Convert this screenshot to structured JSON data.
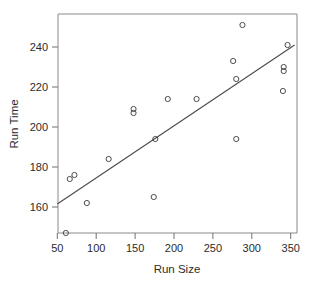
{
  "chart_data": {
    "type": "scatter",
    "title": "",
    "xlabel": "Run Size",
    "ylabel": "Run Time",
    "xlim": [
      47,
      355
    ],
    "ylim": [
      143,
      256
    ],
    "grid": false,
    "legend": null,
    "xticks": [
      50,
      100,
      150,
      200,
      250,
      300,
      350
    ],
    "xtick_labels": [
      "50",
      "100",
      "150",
      "200",
      "250",
      "300",
      "350"
    ],
    "yticks": [
      160,
      180,
      200,
      220,
      240
    ],
    "ytick_labels": [
      "160",
      "180",
      "200",
      "220",
      "240"
    ],
    "marker": "open-circle",
    "points": [
      {
        "x": 61,
        "y": 147
      },
      {
        "x": 66,
        "y": 174
      },
      {
        "x": 72,
        "y": 176
      },
      {
        "x": 88,
        "y": 162
      },
      {
        "x": 116,
        "y": 184
      },
      {
        "x": 148,
        "y": 207
      },
      {
        "x": 148,
        "y": 209
      },
      {
        "x": 174,
        "y": 165
      },
      {
        "x": 176,
        "y": 194
      },
      {
        "x": 192,
        "y": 214
      },
      {
        "x": 229,
        "y": 214
      },
      {
        "x": 276,
        "y": 233
      },
      {
        "x": 280,
        "y": 224
      },
      {
        "x": 280,
        "y": 194
      },
      {
        "x": 288,
        "y": 251
      },
      {
        "x": 340,
        "y": 218
      },
      {
        "x": 341,
        "y": 228
      },
      {
        "x": 341,
        "y": 230
      },
      {
        "x": 346,
        "y": 241
      }
    ],
    "fit_line": {
      "type": "linear-regression",
      "x_start": 50,
      "y_start": 161.5,
      "x_end": 355,
      "y_end": 241.0
    }
  }
}
